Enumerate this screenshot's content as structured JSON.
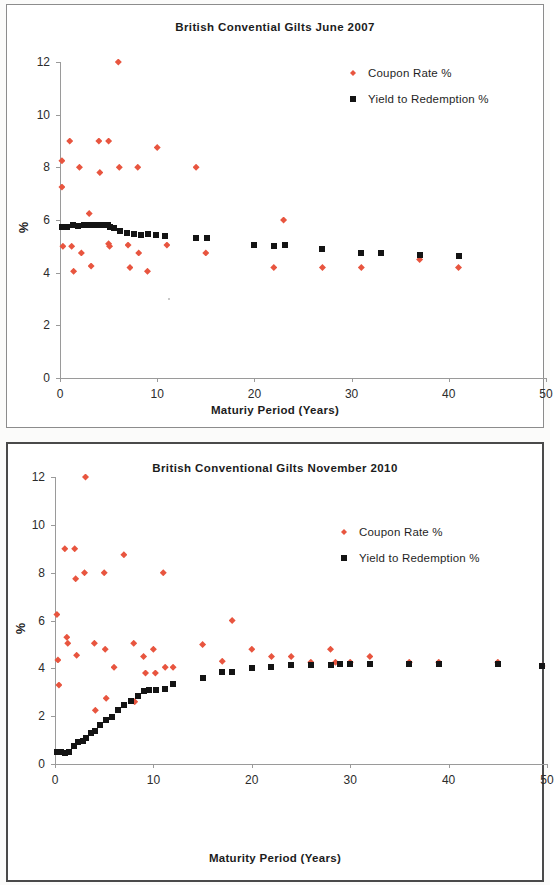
{
  "charts": [
    {
      "id": "chart-1",
      "title": "British Convential Gilts June 2007",
      "xlabel": "Maturiy Period (Years)",
      "ylabel": "%",
      "legend": [
        {
          "label": "Coupon Rate %",
          "marker": "diamond-icon",
          "color": "#e8553f"
        },
        {
          "label": "Yield to Redemption %",
          "marker": "square-icon",
          "color": "#141414"
        }
      ],
      "yticks": [
        "0",
        "2",
        "4",
        "6",
        "8",
        "10",
        "12"
      ],
      "xticks": [
        "0",
        "10",
        "20",
        "30",
        "40",
        "50"
      ]
    },
    {
      "id": "chart-2",
      "title": "British Conventional Gilts November 2010",
      "xlabel": "Maturity Period (Years)",
      "ylabel": "%",
      "legend": [
        {
          "label": "Coupon Rate %",
          "marker": "diamond-icon",
          "color": "#e8553f"
        },
        {
          "label": "Yield to Redemption %",
          "marker": "square-icon",
          "color": "#141414"
        }
      ],
      "yticks": [
        "0",
        "2",
        "4",
        "6",
        "8",
        "10",
        "12"
      ],
      "xticks": [
        "0",
        "10",
        "20",
        "30",
        "40",
        "50"
      ]
    }
  ],
  "chart_data": [
    {
      "type": "scatter",
      "title": "British Convential Gilts June 2007",
      "xlabel": "Maturiy Period (Years)",
      "ylabel": "%",
      "xlim": [
        0,
        50
      ],
      "ylim": [
        0,
        12
      ],
      "xticks": [
        0,
        10,
        20,
        30,
        40,
        50
      ],
      "yticks": [
        0,
        2,
        4,
        6,
        8,
        10,
        12
      ],
      "grid": false,
      "legend_position": "top-right",
      "series": [
        {
          "name": "Coupon Rate %",
          "marker": "diamond",
          "color": "#e8553f",
          "points": [
            [
              0.2,
              8.25
            ],
            [
              0.2,
              7.25
            ],
            [
              0.3,
              5.0
            ],
            [
              1.0,
              9.0
            ],
            [
              1.2,
              5.0
            ],
            [
              1.4,
              4.05
            ],
            [
              2.0,
              8.0
            ],
            [
              2.2,
              4.75
            ],
            [
              3.0,
              6.25
            ],
            [
              3.2,
              4.25
            ],
            [
              4.0,
              9.0
            ],
            [
              4.1,
              7.8
            ],
            [
              5.0,
              9.0
            ],
            [
              5.0,
              5.1
            ],
            [
              5.1,
              5.0
            ],
            [
              6.0,
              12.0
            ],
            [
              6.1,
              8.0
            ],
            [
              7.0,
              5.05
            ],
            [
              7.2,
              4.2
            ],
            [
              8.0,
              8.0
            ],
            [
              8.1,
              4.75
            ],
            [
              9.0,
              4.05
            ],
            [
              10.0,
              8.75
            ],
            [
              11.0,
              5.05
            ],
            [
              14.0,
              8.0
            ],
            [
              15.0,
              4.75
            ],
            [
              22.0,
              4.2
            ],
            [
              23.0,
              6.0
            ],
            [
              27.0,
              4.2
            ],
            [
              31.0,
              4.2
            ],
            [
              37.0,
              4.5
            ],
            [
              41.0,
              4.2
            ]
          ]
        },
        {
          "name": "Yield to Redemption %",
          "marker": "square",
          "color": "#141414",
          "points": [
            [
              0.2,
              5.72
            ],
            [
              0.7,
              5.75
            ],
            [
              1.3,
              5.8
            ],
            [
              1.9,
              5.78
            ],
            [
              2.5,
              5.8
            ],
            [
              3.1,
              5.8
            ],
            [
              3.7,
              5.8
            ],
            [
              4.3,
              5.8
            ],
            [
              4.9,
              5.8
            ],
            [
              5.1,
              5.72
            ],
            [
              5.6,
              5.68
            ],
            [
              6.2,
              5.6
            ],
            [
              6.9,
              5.5
            ],
            [
              7.6,
              5.45
            ],
            [
              8.3,
              5.42
            ],
            [
              9.1,
              5.45
            ],
            [
              9.9,
              5.42
            ],
            [
              10.8,
              5.38
            ],
            [
              14.0,
              5.3
            ],
            [
              15.1,
              5.32
            ],
            [
              20.0,
              5.05
            ],
            [
              22.0,
              5.02
            ],
            [
              23.1,
              5.05
            ],
            [
              27.0,
              4.88
            ],
            [
              31.0,
              4.75
            ],
            [
              33.0,
              4.75
            ],
            [
              37.0,
              4.68
            ],
            [
              41.0,
              4.65
            ]
          ]
        }
      ]
    },
    {
      "type": "scatter",
      "title": "British Conventional Gilts November 2010",
      "xlabel": "Maturity Period (Years)",
      "ylabel": "%",
      "xlim": [
        0,
        50
      ],
      "ylim": [
        0,
        12
      ],
      "xticks": [
        0,
        10,
        20,
        30,
        40,
        50
      ],
      "yticks": [
        0,
        2,
        4,
        6,
        8,
        10,
        12
      ],
      "grid": false,
      "legend_position": "top-right",
      "series": [
        {
          "name": "Coupon Rate %",
          "marker": "diamond",
          "color": "#e8553f",
          "points": [
            [
              0.2,
              6.25
            ],
            [
              0.3,
              4.35
            ],
            [
              0.4,
              3.3
            ],
            [
              1.0,
              9.0
            ],
            [
              1.2,
              5.3
            ],
            [
              1.3,
              5.05
            ],
            [
              2.0,
              9.0
            ],
            [
              2.1,
              7.75
            ],
            [
              2.2,
              4.55
            ],
            [
              3.0,
              8.0
            ],
            [
              3.1,
              12.0
            ],
            [
              4.0,
              5.05
            ],
            [
              4.1,
              2.25
            ],
            [
              5.0,
              8.0
            ],
            [
              5.1,
              4.8
            ],
            [
              5.2,
              2.75
            ],
            [
              6.0,
              4.05
            ],
            [
              7.0,
              8.75
            ],
            [
              8.0,
              5.05
            ],
            [
              8.1,
              2.6
            ],
            [
              9.0,
              4.5
            ],
            [
              9.2,
              3.8
            ],
            [
              10.0,
              4.8
            ],
            [
              10.2,
              3.8
            ],
            [
              11.0,
              8.0
            ],
            [
              11.2,
              4.05
            ],
            [
              12.0,
              4.05
            ],
            [
              15.0,
              5.0
            ],
            [
              17.0,
              4.3
            ],
            [
              18.0,
              6.0
            ],
            [
              20.0,
              4.8
            ],
            [
              22.0,
              4.5
            ],
            [
              24.0,
              4.5
            ],
            [
              26.0,
              4.25
            ],
            [
              28.0,
              4.8
            ],
            [
              28.5,
              4.25
            ],
            [
              30.0,
              4.25
            ],
            [
              32.0,
              4.5
            ],
            [
              36.0,
              4.25
            ],
            [
              39.0,
              4.25
            ],
            [
              45.0,
              4.25
            ],
            [
              49.5,
              4.1
            ]
          ]
        },
        {
          "name": "Yield to Redemption %",
          "marker": "square",
          "color": "#141414",
          "points": [
            [
              0.2,
              0.5
            ],
            [
              0.6,
              0.52
            ],
            [
              1.0,
              0.45
            ],
            [
              1.4,
              0.5
            ],
            [
              1.9,
              0.75
            ],
            [
              2.3,
              0.9
            ],
            [
              2.8,
              0.95
            ],
            [
              3.2,
              1.1
            ],
            [
              3.7,
              1.3
            ],
            [
              4.1,
              1.4
            ],
            [
              4.6,
              1.65
            ],
            [
              5.2,
              1.85
            ],
            [
              5.8,
              1.95
            ],
            [
              6.4,
              2.25
            ],
            [
              7.0,
              2.45
            ],
            [
              7.7,
              2.65
            ],
            [
              8.4,
              2.85
            ],
            [
              9.0,
              3.05
            ],
            [
              9.6,
              3.1
            ],
            [
              10.3,
              3.1
            ],
            [
              11.2,
              3.15
            ],
            [
              12.0,
              3.35
            ],
            [
              15.0,
              3.6
            ],
            [
              17.0,
              3.85
            ],
            [
              18.0,
              3.85
            ],
            [
              20.0,
              4.0
            ],
            [
              22.0,
              4.05
            ],
            [
              24.0,
              4.15
            ],
            [
              26.0,
              4.15
            ],
            [
              28.0,
              4.15
            ],
            [
              29.0,
              4.2
            ],
            [
              30.0,
              4.2
            ],
            [
              32.0,
              4.2
            ],
            [
              36.0,
              4.2
            ],
            [
              39.0,
              4.2
            ],
            [
              45.0,
              4.2
            ],
            [
              49.5,
              4.1
            ]
          ]
        }
      ]
    }
  ]
}
